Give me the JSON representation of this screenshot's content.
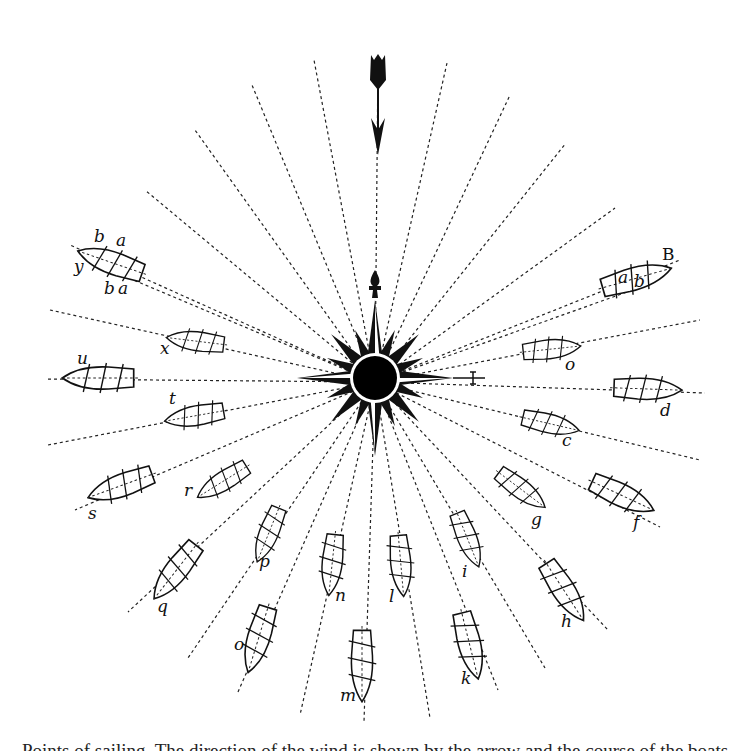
{
  "figure": {
    "caption": "Points of sailing. The direction of the wind is shown by the arrow and the course of the boats ...",
    "center": [
      375,
      382
    ],
    "wind_arrow": {
      "direction": "down",
      "from": [
        375,
        50
      ],
      "to": [
        375,
        155
      ]
    },
    "marker_B": "B",
    "boats": [
      {
        "id": "y",
        "label": "y",
        "x": 118,
        "y": 262,
        "angle": 199,
        "extra_labels": [
          "b",
          "a",
          "b",
          "a"
        ]
      },
      {
        "id": "B",
        "label": "B",
        "x": 632,
        "y": 277,
        "angle": -15,
        "extra_labels": [
          "a",
          "b"
        ]
      },
      {
        "id": "x",
        "label": "x",
        "x": 192,
        "y": 340,
        "angle": 187
      },
      {
        "id": "o_upper",
        "label": "o",
        "x": 553,
        "y": 348,
        "angle": -7
      },
      {
        "id": "u",
        "label": "u",
        "x": 97,
        "y": 378,
        "angle": 180
      },
      {
        "id": "d",
        "label": "d",
        "x": 648,
        "y": 389,
        "angle": 3
      },
      {
        "id": "t",
        "label": "t",
        "x": 195,
        "y": 415,
        "angle": 170
      },
      {
        "id": "c",
        "label": "c",
        "x": 552,
        "y": 423,
        "angle": 12
      },
      {
        "id": "s",
        "label": "s",
        "x": 118,
        "y": 486,
        "angle": 160
      },
      {
        "id": "f",
        "label": "f",
        "x": 622,
        "y": 497,
        "angle": 24
      },
      {
        "id": "r",
        "label": "r",
        "x": 220,
        "y": 483,
        "angle": 150
      },
      {
        "id": "g",
        "label": "g",
        "x": 522,
        "y": 490,
        "angle": 35
      },
      {
        "id": "p",
        "label": "p",
        "x": 268,
        "y": 535,
        "angle": 113
      },
      {
        "id": "i",
        "label": "i",
        "x": 468,
        "y": 540,
        "angle": 68
      },
      {
        "id": "q",
        "label": "q",
        "x": 175,
        "y": 572,
        "angle": 130
      },
      {
        "id": "h",
        "label": "h",
        "x": 565,
        "y": 592,
        "angle": 58
      },
      {
        "id": "n",
        "label": "n",
        "x": 332,
        "y": 565,
        "angle": 95
      },
      {
        "id": "l",
        "label": "l",
        "x": 401,
        "y": 566,
        "angle": 85
      },
      {
        "id": "o_lower",
        "label": "o",
        "x": 258,
        "y": 640,
        "angle": 107
      },
      {
        "id": "k",
        "label": "k",
        "x": 470,
        "y": 645,
        "angle": 77
      },
      {
        "id": "m",
        "label": "m",
        "x": 362,
        "y": 665,
        "angle": 90
      }
    ]
  },
  "labels": {
    "y": "y",
    "b_top": "b",
    "a_top": "a",
    "b_bot": "b",
    "a_bot": "a",
    "B": "B",
    "aB": "a",
    "bB": "b",
    "x": "x",
    "o_upper": "o",
    "u": "u",
    "d": "d",
    "t": "t",
    "c": "c",
    "s": "s",
    "f": "f",
    "r": "r",
    "g": "g",
    "p": "p",
    "i": "i",
    "q": "q",
    "h": "h",
    "n": "n",
    "l": "l",
    "o_lower": "o",
    "k": "k",
    "m": "m"
  },
  "caption": "Points of sailing. The direction of the wind is shown by the arrow and the course of the boats ..."
}
